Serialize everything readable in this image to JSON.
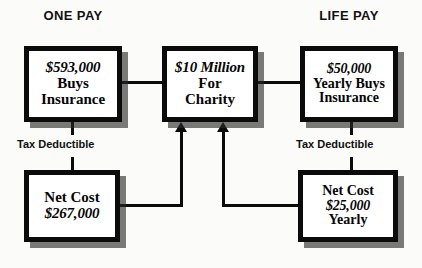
{
  "diagram": {
    "headings": {
      "left": "ONE PAY",
      "right": "LIFE PAY"
    },
    "nodes": {
      "one_pay_premium": {
        "line1": "$593,000",
        "line2": "Buys",
        "line3": "Insurance"
      },
      "charity": {
        "line1": "$10 Million",
        "line2": "For",
        "line3": "Charity"
      },
      "life_pay_premium": {
        "line1": "$50,000",
        "line2": "Yearly Buys",
        "line3": "Insurance"
      },
      "one_pay_net_cost": {
        "line1": "Net Cost",
        "line2": "$267,000"
      },
      "life_pay_net_cost": {
        "line1": "Net Cost",
        "line2": "$25,000",
        "line3": "Yearly"
      }
    },
    "connector_labels": {
      "left_tax": "Tax Deductible",
      "right_tax": "Tax Deductible"
    },
    "colors": {
      "ink": "#0b0b0b",
      "shadow": "#4a4a4a",
      "paper": "#fbfbfa"
    }
  }
}
